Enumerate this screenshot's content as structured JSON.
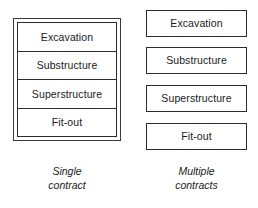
{
  "figure": {
    "background_color": "#ffffff",
    "line_color": "#2b2b2b"
  },
  "single_contract": {
    "caption_line1": "Single",
    "caption_line2": "contract",
    "phases": [
      {
        "label": "Excavation"
      },
      {
        "label": "Substructure"
      },
      {
        "label": "Superstructure"
      },
      {
        "label": "Fit-out"
      }
    ]
  },
  "multiple_contracts": {
    "caption_line1": "Multiple",
    "caption_line2": "contracts",
    "phases": [
      {
        "label": "Excavation"
      },
      {
        "label": "Substructure"
      },
      {
        "label": "Superstructure"
      },
      {
        "label": "Fit-out"
      }
    ]
  }
}
